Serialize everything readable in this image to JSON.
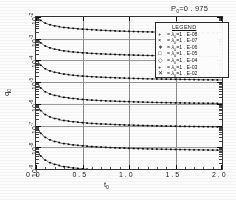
{
  "figure": {
    "title": "P",
    "title_sub": "0",
    "title_value": "=0 . 975",
    "background_color": "#ffffff",
    "line_color": "#151515"
  },
  "legend": {
    "heading": "LEGEND",
    "entries": [
      {
        "marker": "+",
        "eq": "=",
        "symbol": "λ",
        "sub": "0",
        "value": "=1 . E-08"
      },
      {
        "marker": "×",
        "eq": "=",
        "symbol": "λ",
        "sub": "0",
        "value": "=1 . E-07"
      },
      {
        "marker": "∗",
        "eq": "=",
        "symbol": "λ",
        "sub": "0",
        "value": "=1 . E-06"
      },
      {
        "marker": "□",
        "eq": "=",
        "symbol": "λ",
        "sub": "0",
        "value": "=1 . E-05"
      },
      {
        "marker": "◇",
        "eq": "=",
        "symbol": "λ",
        "sub": "0",
        "value": "=1 . E-04"
      },
      {
        "marker": "+",
        "eq": "=",
        "symbol": "λ",
        "sub": "0",
        "value": "=1 . E-03"
      },
      {
        "marker": "✕",
        "eq": "=",
        "symbol": "λ",
        "sub": "0",
        "value": "=1 . E-02"
      }
    ]
  },
  "axes": {
    "y_title": "q",
    "y_title_sub": "0",
    "x_title": "t",
    "x_title_sub": "0",
    "y_ticks": [
      "10",
      "10",
      "10",
      "10",
      "10",
      "10",
      "10",
      "10"
    ],
    "y_exponents": [
      "-2",
      "-3",
      "-4",
      "-5",
      "-6",
      "-7",
      "-8",
      "-9"
    ],
    "x_ticks": [
      "0 . 0",
      "0 . 5",
      "1 . 0",
      "1 . 5",
      "2 . 0"
    ]
  },
  "chart_data": {
    "type": "line",
    "xlabel": "t0",
    "ylabel": "q0",
    "xlim": [
      0.0,
      2.0
    ],
    "ylim": [
      1e-09,
      0.01
    ],
    "yscale": "log",
    "xscale": "linear",
    "grid": true,
    "legend_position": "upper-right",
    "x": [
      0.02,
      0.05,
      0.1,
      0.15,
      0.2,
      0.3,
      0.4,
      0.5,
      0.6,
      0.7,
      0.8,
      0.9,
      1.0,
      1.1,
      1.2,
      1.3,
      1.4,
      1.5,
      1.6,
      1.7,
      1.8,
      1.9,
      2.0
    ],
    "series": [
      {
        "name": "λ0=1.E-02",
        "values": [
          0.009,
          0.007,
          0.0052,
          0.0044,
          0.0039,
          0.0033,
          0.003,
          0.00275,
          0.0026,
          0.00245,
          0.00235,
          0.00225,
          0.00218,
          0.00212,
          0.00207,
          0.00202,
          0.00198,
          0.00195,
          0.00192,
          0.00189,
          0.00187,
          0.00185,
          0.00183
        ]
      },
      {
        "name": "λ0=1.E-03",
        "values": [
          0.0009,
          0.00065,
          0.00046,
          0.00038,
          0.00033,
          0.000275,
          0.000245,
          0.000225,
          0.00021,
          0.0002,
          0.000192,
          0.000185,
          0.000179,
          0.000174,
          0.00017,
          0.000166,
          0.000163,
          0.00016,
          0.000158,
          0.000156,
          0.000154,
          0.000152,
          0.00015
        ]
      },
      {
        "name": "λ0=1.E-04",
        "values": [
          8.5e-05,
          6e-05,
          4.1e-05,
          3.3e-05,
          2.85e-05,
          2.35e-05,
          2.08e-05,
          1.9e-05,
          1.78e-05,
          1.69e-05,
          1.62e-05,
          1.56e-05,
          1.51e-05,
          1.47e-05,
          1.43e-05,
          1.4e-05,
          1.37e-05,
          1.35e-05,
          1.33e-05,
          1.31e-05,
          1.29e-05,
          1.28e-05,
          1.26e-05
        ]
      },
      {
        "name": "λ0=1.E-05",
        "values": [
          8e-06,
          5.4e-06,
          3.6e-06,
          2.85e-06,
          2.45e-06,
          2e-06,
          1.76e-06,
          1.6e-06,
          1.49e-06,
          1.41e-06,
          1.35e-06,
          1.3e-06,
          1.26e-06,
          1.22e-06,
          1.19e-06,
          1.16e-06,
          1.14e-06,
          1.12e-06,
          1.1e-06,
          1.08e-06,
          1.07e-06,
          1.06e-06,
          1.04e-06
        ]
      },
      {
        "name": "λ0=1.E-06",
        "values": [
          7.4e-07,
          4.9e-07,
          3.2e-07,
          2.5e-07,
          2.12e-07,
          1.71e-07,
          1.5e-07,
          1.36e-07,
          1.26e-07,
          1.19e-07,
          1.14e-07,
          1.09e-07,
          1.05e-07,
          1.02e-07,
          9.95e-08,
          9.72e-08,
          9.52e-08,
          9.35e-08,
          9.19e-08,
          9.05e-08,
          8.93e-08,
          8.82e-08,
          8.72e-08
        ]
      },
      {
        "name": "λ0=1.E-07",
        "values": [
          6.9e-08,
          4.4e-08,
          2.85e-08,
          2.2e-08,
          1.85e-08,
          1.48e-08,
          1.29e-08,
          1.17e-08,
          1.08e-08,
          1.02e-08,
          9.7e-09,
          9.3e-09,
          8.95e-09,
          8.68e-09,
          8.45e-09,
          8.25e-09,
          8.08e-09,
          7.92e-09,
          7.79e-09,
          7.67e-09,
          7.56e-09,
          7.46e-09,
          7.37e-09
        ]
      },
      {
        "name": "λ0=1.E-08",
        "values": [
          6.4e-09,
          4e-09,
          2.55e-09,
          1.96e-09,
          1.63e-09,
          1.29e-09,
          1.12e-09,
          1.01e-09,
          9.35e-10,
          8.8e-10,
          8.37e-10,
          8.02e-10,
          7.73e-10,
          7.48e-10,
          7.27e-10,
          7.09e-10,
          6.93e-10,
          6.79e-10,
          6.67e-10,
          6.56e-10,
          6.46e-10,
          6.37e-10,
          6.29e-10
        ]
      }
    ]
  }
}
